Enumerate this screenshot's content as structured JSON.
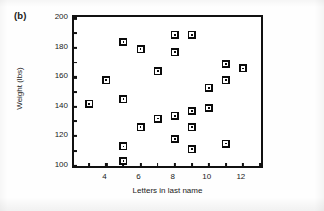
{
  "figure": {
    "panel_label": "(b)",
    "background_color": "#ffffff",
    "frame_color": "#111111",
    "marker_color": "#0b0b0b"
  },
  "chart_data": {
    "type": "scatter",
    "title": "(b)",
    "xlabel": "Letters in last name",
    "ylabel": "Weight (lbs)",
    "xlim": [
      2.1,
      13.3
    ],
    "ylim": [
      97,
      201
    ],
    "grid": false,
    "legend": null,
    "x_major_ticks": [
      4,
      6,
      8,
      10,
      12
    ],
    "x_tick_labels": [
      "4",
      "6",
      "8",
      "10",
      "12"
    ],
    "y_major_ticks": [
      100,
      120,
      140,
      160,
      180,
      200
    ],
    "y_tick_labels": [
      "100",
      "120",
      "140",
      "160",
      "180",
      "200"
    ],
    "y_minor_ticks": [
      110,
      130,
      150,
      170,
      190
    ],
    "marker_style": "square-with-white-ring",
    "x": [
      3,
      4,
      5,
      5,
      5,
      5,
      6,
      6,
      7,
      7,
      8,
      8,
      8,
      8,
      9,
      9,
      9,
      9,
      10,
      10,
      11,
      11,
      11,
      12
    ],
    "y": [
      142,
      158,
      184,
      145,
      113,
      103,
      179,
      126,
      164,
      132,
      189,
      177,
      134,
      118,
      189,
      137,
      126,
      111,
      153,
      139,
      169,
      158,
      115,
      166
    ],
    "points": [
      {
        "x": 3,
        "y": 142
      },
      {
        "x": 4,
        "y": 158
      },
      {
        "x": 5,
        "y": 184
      },
      {
        "x": 5,
        "y": 145
      },
      {
        "x": 5,
        "y": 113
      },
      {
        "x": 5,
        "y": 103
      },
      {
        "x": 6,
        "y": 179
      },
      {
        "x": 6,
        "y": 126
      },
      {
        "x": 7,
        "y": 164
      },
      {
        "x": 7,
        "y": 132
      },
      {
        "x": 8,
        "y": 189
      },
      {
        "x": 8,
        "y": 177
      },
      {
        "x": 8,
        "y": 134
      },
      {
        "x": 8,
        "y": 118
      },
      {
        "x": 9,
        "y": 189
      },
      {
        "x": 9,
        "y": 137
      },
      {
        "x": 9,
        "y": 126
      },
      {
        "x": 9,
        "y": 111
      },
      {
        "x": 10,
        "y": 153
      },
      {
        "x": 10,
        "y": 139
      },
      {
        "x": 11,
        "y": 169
      },
      {
        "x": 11,
        "y": 158
      },
      {
        "x": 11,
        "y": 115
      },
      {
        "x": 12,
        "y": 166
      }
    ]
  }
}
